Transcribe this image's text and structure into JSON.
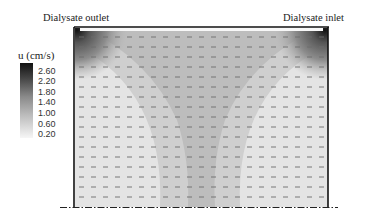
{
  "labels": {
    "outlet": "Dialysate outlet",
    "inlet": "Dialysate inlet",
    "colorbar_title": "u (cm/s)"
  },
  "colorbar": {
    "ticks": [
      "2.60",
      "2.20",
      "1.80",
      "1.40",
      "1.00",
      "0.60",
      "0.20"
    ],
    "colormap": "grayscale, dark = high"
  }
}
